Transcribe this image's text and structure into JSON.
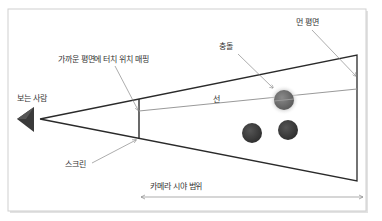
{
  "diagram": {
    "labels": {
      "viewer": "보는 사람",
      "near_plane_mapping": "가까운 평면에 터치 위치 매핑",
      "collision": "충돌",
      "far_plane": "먼 평면",
      "ray": "선",
      "screen": "스크린",
      "camera_fov": "카메라 시야 범위"
    },
    "colors": {
      "frame_border": "#c8c8c8",
      "frame_shadow": "#dcdcdc",
      "frustum_line": "#2a2a2a",
      "ray_line": "#9a9a9a",
      "leader_line": "#8a8a8a",
      "viewer_triangle": "#3a3a3a",
      "collision_sphere": "#6e6e6e",
      "collision_glow": "#d0d0d0",
      "object_sphere": "#3c3c3c"
    }
  }
}
